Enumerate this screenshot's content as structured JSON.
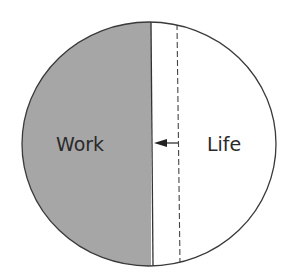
{
  "diagram": {
    "type": "work-life-balance-circle",
    "regions": [
      {
        "id": "work",
        "label": "Work",
        "fill": "#a6a6a6"
      },
      {
        "id": "life",
        "label": "Life",
        "fill": "#ffffff"
      }
    ],
    "divider": {
      "style": "solid",
      "color": "#333333"
    },
    "previous_divider": {
      "style": "dashed",
      "color": "#444444"
    },
    "arrow": {
      "direction": "left",
      "meaning": "work expanding into life"
    },
    "colors": {
      "outline": "#3a3a3a",
      "work_fill": "#a6a6a6",
      "life_fill": "#ffffff",
      "text": "#2a2a2a"
    }
  }
}
